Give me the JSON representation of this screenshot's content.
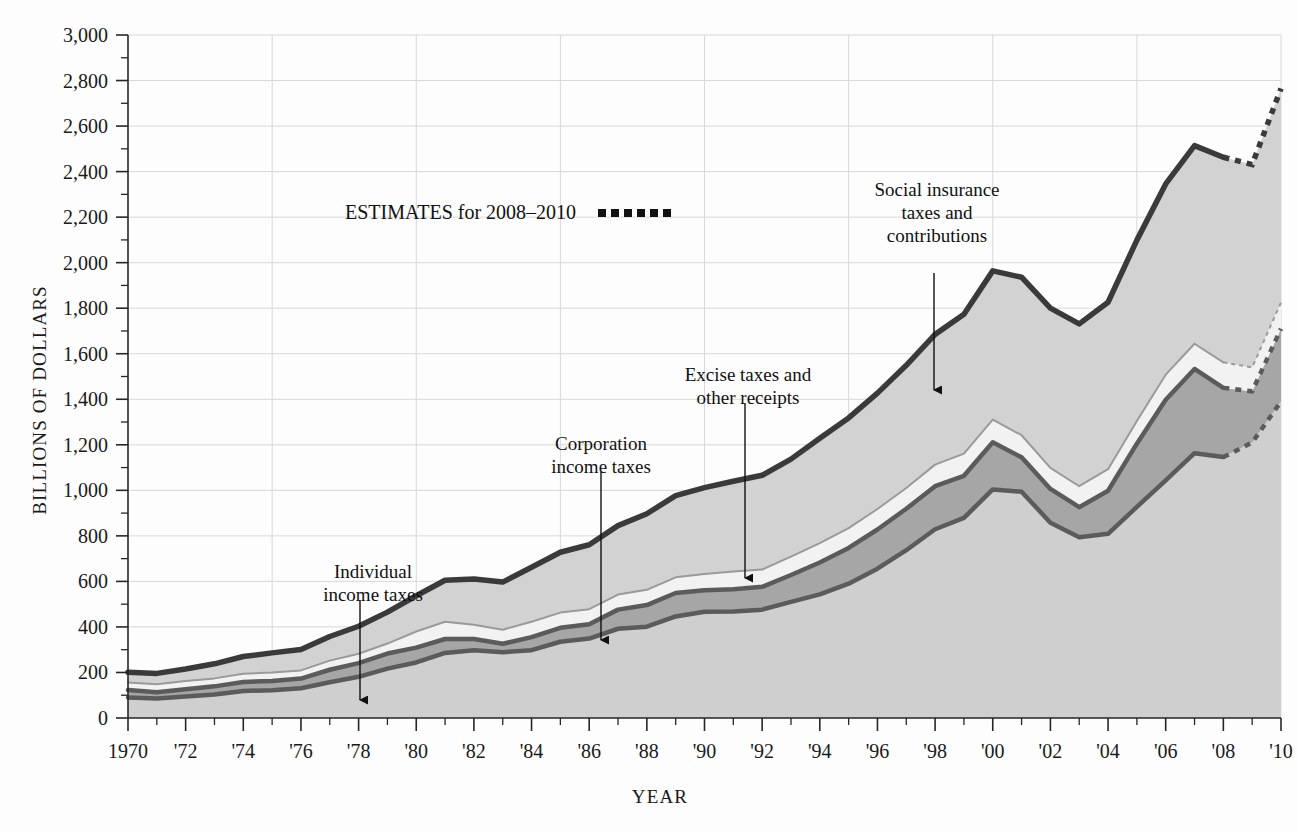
{
  "chart_data": {
    "type": "area",
    "stacked": true,
    "title": "",
    "xlabel": "YEAR",
    "ylabel": "BILLIONS OF DOLLARS",
    "xlim": [
      1970,
      2010
    ],
    "ylim": [
      0,
      3000
    ],
    "grid": true,
    "legend_position": "inline-annotations",
    "x": [
      1970,
      1971,
      1972,
      1973,
      1974,
      1975,
      1976,
      1977,
      1978,
      1979,
      1980,
      1981,
      1982,
      1983,
      1984,
      1985,
      1986,
      1987,
      1988,
      1989,
      1990,
      1991,
      1992,
      1993,
      1994,
      1995,
      1996,
      1997,
      1998,
      1999,
      2000,
      2001,
      2002,
      2003,
      2004,
      2005,
      2006,
      2007,
      2008,
      2009,
      2010
    ],
    "xtick_labels": [
      "1970",
      "'72",
      "'74",
      "'76",
      "'78",
      "'80",
      "'82",
      "'84",
      "'86",
      "'88",
      "'90",
      "'92",
      "'94",
      "'96",
      "'98",
      "'00",
      "'02",
      "'04",
      "'06",
      "'08",
      "'10"
    ],
    "ytick_labels": [
      "0",
      "200",
      "400",
      "600",
      "800",
      "1,000",
      "1,200",
      "1,400",
      "1,600",
      "1,800",
      "2,000",
      "2,200",
      "2,400",
      "2,600",
      "2,800",
      "3,000"
    ],
    "ytick_values": [
      0,
      200,
      400,
      600,
      800,
      1000,
      1200,
      1400,
      1600,
      1800,
      2000,
      2200,
      2400,
      2600,
      2800,
      3000
    ],
    "estimate_start_year": 2008,
    "series": [
      {
        "name": "Individual income taxes",
        "fill": "#cfcfcf",
        "line": "#5b5b5b",
        "values": [
          90,
          86,
          94,
          103,
          119,
          122,
          131,
          157,
          181,
          217,
          244,
          286,
          298,
          289,
          298,
          335,
          349,
          392,
          401,
          446,
          467,
          468,
          476,
          510,
          543,
          590,
          656,
          737,
          829,
          879,
          1004,
          994,
          858,
          794,
          809,
          927,
          1044,
          1163,
          1146,
          1210,
          1390
        ]
      },
      {
        "name": "Corporation income taxes",
        "fill": "#a6a6a6",
        "line": "#5b5b5b",
        "values": [
          33,
          27,
          32,
          36,
          39,
          41,
          42,
          55,
          60,
          66,
          65,
          61,
          49,
          37,
          57,
          61,
          63,
          84,
          95,
          103,
          94,
          98,
          100,
          118,
          140,
          157,
          172,
          182,
          189,
          185,
          207,
          151,
          148,
          132,
          189,
          278,
          354,
          370,
          304,
          225,
          320
        ]
      },
      {
        "name": "Excise taxes and other receipts",
        "fill": "#f2f2f2",
        "line": "#9a9a9a",
        "values": [
          33,
          35,
          36,
          35,
          36,
          37,
          36,
          40,
          41,
          44,
          71,
          76,
          63,
          62,
          68,
          67,
          66,
          66,
          67,
          69,
          71,
          78,
          76,
          81,
          85,
          87,
          90,
          91,
          95,
          97,
          100,
          97,
          93,
          92,
          95,
          100,
          110,
          111,
          112,
          105,
          115
        ]
      },
      {
        "name": "Social insurance taxes and contributions",
        "fill": "#d2d2d2",
        "line": "#3a3a3a",
        "values": [
          45,
          48,
          53,
          64,
          76,
          86,
          92,
          106,
          121,
          138,
          157,
          182,
          201,
          209,
          239,
          265,
          283,
          303,
          334,
          359,
          380,
          396,
          414,
          428,
          461,
          484,
          509,
          539,
          572,
          612,
          653,
          694,
          701,
          713,
          733,
          794,
          838,
          870,
          901,
          891,
          940
        ]
      }
    ],
    "totals": [
      201,
      196,
      215,
      238,
      270,
      286,
      301,
      358,
      403,
      465,
      537,
      605,
      611,
      597,
      662,
      728,
      761,
      845,
      897,
      977,
      1012,
      1040,
      1066,
      1137,
      1229,
      1318,
      1427,
      1549,
      1685,
      1773,
      1964,
      1936,
      1800,
      1731,
      1826,
      2099,
      2346,
      2514,
      2463,
      2431,
      2765
    ],
    "annotations": [
      {
        "id": "individual-income-taxes",
        "label": "Individual\nincome taxes",
        "lines": [
          "Individual",
          "income taxes"
        ],
        "text_x": 373,
        "text_y": 578,
        "arrow_x": 360,
        "arrow_y1": 600,
        "arrow_y2": 700
      },
      {
        "id": "corporation-income-taxes",
        "label": "Corporation\nincome taxes",
        "lines": [
          "Corporation",
          "income taxes"
        ],
        "text_x": 601,
        "text_y": 450,
        "arrow_x": 601,
        "arrow_y1": 472,
        "arrow_y2": 640
      },
      {
        "id": "excise-taxes-and-other-receipts",
        "label": "Excise taxes and\nother receipts",
        "lines": [
          "Excise taxes and",
          "other receipts"
        ],
        "text_x": 748,
        "text_y": 381,
        "arrow_x": 745,
        "arrow_y1": 403,
        "arrow_y2": 578
      },
      {
        "id": "social-insurance-taxes-and-contributions",
        "label": "Social insurance\ntaxes and\ncontributions",
        "lines": [
          "Social insurance",
          "taxes and",
          "contributions"
        ],
        "text_x": 937,
        "text_y": 196,
        "arrow_x": 934,
        "arrow_y1": 250,
        "arrow_y2": 390
      }
    ],
    "legend_note": {
      "text": "ESTIMATES for 2008–2010",
      "swatch": "dotted-line",
      "x": 345,
      "y": 219
    },
    "colors": {
      "grid": "#d8d8d8",
      "axis": "#262626",
      "band_individual": "#cfcfcf",
      "band_corporation": "#a6a6a6",
      "band_excise": "#f2f2f2",
      "band_social": "#d2d2d2",
      "line_dark": "#3a3a3a",
      "line_mid": "#5b5b5b",
      "line_light": "#9a9a9a",
      "background": "#fdfdfd"
    }
  },
  "axes": {
    "y_title": "BILLIONS OF DOLLARS",
    "x_title": "YEAR"
  }
}
